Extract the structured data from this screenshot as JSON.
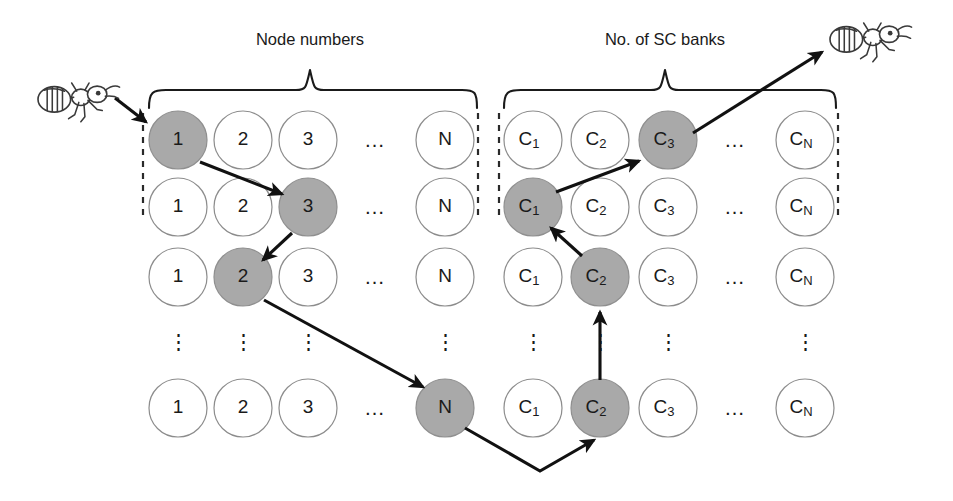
{
  "figure": {
    "title_left": "Node numbers",
    "title_right": "No. of SC banks",
    "highlight_color": "#a9a9a9",
    "circle_outline_color": "#8c8c8c",
    "path_color": "#111111"
  },
  "left_grid": {
    "label": "Node numbers",
    "columns": [
      "1",
      "2",
      "3",
      "…",
      "N"
    ],
    "rows": [
      {
        "cells": [
          {
            "text": "1",
            "sub": "",
            "filled": true
          },
          {
            "text": "2",
            "sub": "",
            "filled": false
          },
          {
            "text": "3",
            "sub": "",
            "filled": false
          },
          {
            "text": "…",
            "sub": "",
            "filled": null
          },
          {
            "text": "N",
            "sub": "",
            "filled": false
          }
        ]
      },
      {
        "cells": [
          {
            "text": "1",
            "sub": "",
            "filled": false
          },
          {
            "text": "2",
            "sub": "",
            "filled": false
          },
          {
            "text": "3",
            "sub": "",
            "filled": true
          },
          {
            "text": "…",
            "sub": "",
            "filled": null
          },
          {
            "text": "N",
            "sub": "",
            "filled": false
          }
        ]
      },
      {
        "cells": [
          {
            "text": "1",
            "sub": "",
            "filled": false
          },
          {
            "text": "2",
            "sub": "",
            "filled": true
          },
          {
            "text": "3",
            "sub": "",
            "filled": false
          },
          {
            "text": "…",
            "sub": "",
            "filled": null
          },
          {
            "text": "N",
            "sub": "",
            "filled": false
          }
        ]
      },
      {
        "cells": [
          {
            "text": "⋮",
            "sub": "",
            "filled": null
          },
          {
            "text": "⋮",
            "sub": "",
            "filled": null
          },
          {
            "text": "⋮",
            "sub": "",
            "filled": null
          },
          {
            "text": "",
            "sub": "",
            "filled": null
          },
          {
            "text": "⋮",
            "sub": "",
            "filled": null
          }
        ]
      },
      {
        "cells": [
          {
            "text": "1",
            "sub": "",
            "filled": false
          },
          {
            "text": "2",
            "sub": "",
            "filled": false
          },
          {
            "text": "3",
            "sub": "",
            "filled": false
          },
          {
            "text": "…",
            "sub": "",
            "filled": null
          },
          {
            "text": "N",
            "sub": "",
            "filled": true
          }
        ]
      }
    ]
  },
  "right_grid": {
    "label": "No. of SC banks",
    "columns": [
      "C1",
      "C2",
      "C3",
      "…",
      "CN"
    ],
    "rows": [
      {
        "cells": [
          {
            "text": "C",
            "sub": "1",
            "filled": false
          },
          {
            "text": "C",
            "sub": "2",
            "filled": false
          },
          {
            "text": "C",
            "sub": "3",
            "filled": true
          },
          {
            "text": "…",
            "sub": "",
            "filled": null
          },
          {
            "text": "C",
            "sub": "N",
            "filled": false
          }
        ]
      },
      {
        "cells": [
          {
            "text": "C",
            "sub": "1",
            "filled": true
          },
          {
            "text": "C",
            "sub": "2",
            "filled": false
          },
          {
            "text": "C",
            "sub": "3",
            "filled": false
          },
          {
            "text": "…",
            "sub": "",
            "filled": null
          },
          {
            "text": "C",
            "sub": "N",
            "filled": false
          }
        ]
      },
      {
        "cells": [
          {
            "text": "C",
            "sub": "1",
            "filled": false
          },
          {
            "text": "C",
            "sub": "2",
            "filled": true
          },
          {
            "text": "C",
            "sub": "3",
            "filled": false
          },
          {
            "text": "…",
            "sub": "",
            "filled": null
          },
          {
            "text": "C",
            "sub": "N",
            "filled": false
          }
        ]
      },
      {
        "cells": [
          {
            "text": "⋮",
            "sub": "",
            "filled": null
          },
          {
            "text": "⋮",
            "sub": "",
            "filled": null
          },
          {
            "text": "⋮",
            "sub": "",
            "filled": null
          },
          {
            "text": "",
            "sub": "",
            "filled": null
          },
          {
            "text": "⋮",
            "sub": "",
            "filled": null
          }
        ]
      },
      {
        "cells": [
          {
            "text": "C",
            "sub": "1",
            "filled": false
          },
          {
            "text": "C",
            "sub": "2",
            "filled": true
          },
          {
            "text": "C",
            "sub": "3",
            "filled": false
          },
          {
            "text": "…",
            "sub": "",
            "filled": null
          },
          {
            "text": "C",
            "sub": "N",
            "filled": false
          }
        ]
      }
    ]
  },
  "icons": {
    "ant_start": "ant-icon",
    "ant_end": "ant-icon"
  },
  "tour_path": [
    {
      "from": "ant-start",
      "to": "node-r1c1"
    },
    {
      "from": "node-r1c1",
      "to": "node-r2c3"
    },
    {
      "from": "node-r2c3",
      "to": "node-r3c2"
    },
    {
      "from": "node-r3c2",
      "to": "node-r5cN"
    },
    {
      "from": "node-r5cN",
      "to": "sc-r5c2"
    },
    {
      "from": "sc-r5c2",
      "to": "sc-r3c2"
    },
    {
      "from": "sc-r3c2",
      "to": "sc-r2c1"
    },
    {
      "from": "sc-r2c1",
      "to": "sc-r1c3"
    },
    {
      "from": "sc-r1c3",
      "to": "ant-end"
    }
  ]
}
